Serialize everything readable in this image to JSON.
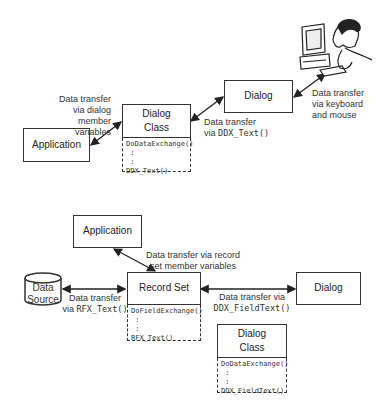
{
  "top": {
    "application": {
      "label": "Application"
    },
    "dialog_class": {
      "label": "Dialog\nClass",
      "methods": [
        "DoDataExchange()",
        " :",
        " :",
        "DDX_Text()"
      ]
    },
    "dialog": {
      "label": "Dialog"
    },
    "user_illustration": "person-at-computer",
    "edges": {
      "app_to_dialog_class": "Data transfer\nvia dialog\nmember\nvariables",
      "dialog_class_to_dialog_prefix": "Data transfer\nvia ",
      "dialog_class_to_dialog_code": "DDX_Text()",
      "dialog_to_user": "Data transfer\nvia keyboard\nand mouse"
    }
  },
  "bottom": {
    "application": {
      "label": "Application"
    },
    "record_set": {
      "label": "Record Set",
      "methods": [
        "DoFieldExchange()",
        " :",
        " :",
        "RFX_Text()"
      ]
    },
    "data_source": {
      "label": "Data\nSource"
    },
    "dialog": {
      "label": "Dialog"
    },
    "dialog_class": {
      "label": "Dialog\nClass",
      "methods": [
        "DoDataExchange()",
        " :",
        " :",
        "DDX_FieldText()"
      ]
    },
    "edges": {
      "app_to_record_set": "Data transfer via record\nset member variables",
      "data_source_to_record_set_prefix": "Data transfer\nvia ",
      "data_source_to_record_set_code": "RFX_Text()",
      "record_set_to_dialog_prefix": "Data transfer via\n",
      "record_set_to_dialog_code": "DDX_FieldText()"
    }
  },
  "colors": {
    "stroke": "#333333",
    "background": "#ffffff"
  }
}
